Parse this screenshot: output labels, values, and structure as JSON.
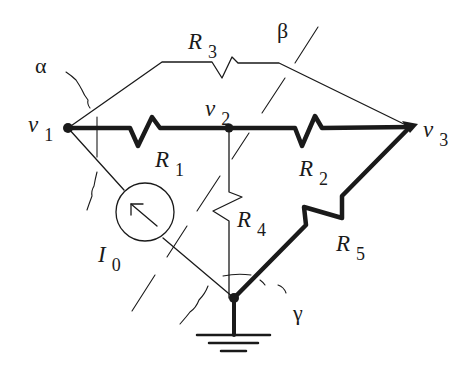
{
  "diagram": {
    "type": "circuit-cutset",
    "colors": {
      "ink": "#1a1a1a",
      "background": "#ffffff"
    },
    "nodes": [
      {
        "id": "v1",
        "label": "v",
        "sub": "1"
      },
      {
        "id": "v2",
        "label": "v",
        "sub": "2"
      },
      {
        "id": "v3",
        "label": "v",
        "sub": "3"
      },
      {
        "id": "ground",
        "label": ""
      }
    ],
    "elements": [
      {
        "id": "R1",
        "label": "R",
        "sub": "1",
        "from": "v1",
        "to": "v2",
        "tree_branch": true
      },
      {
        "id": "R2",
        "label": "R",
        "sub": "2",
        "from": "v2",
        "to": "v3",
        "tree_branch": true
      },
      {
        "id": "R3",
        "label": "R",
        "sub": "3",
        "from": "v1",
        "to": "v3",
        "tree_branch": false
      },
      {
        "id": "R4",
        "label": "R",
        "sub": "4",
        "from": "v2",
        "to": "ground",
        "tree_branch": false
      },
      {
        "id": "R5",
        "label": "R",
        "sub": "5",
        "from": "ground",
        "to": "v3",
        "tree_branch": true
      },
      {
        "id": "I0",
        "label": "I",
        "sub": "0",
        "type": "current-source",
        "from": "ground",
        "to": "v1",
        "tree_branch": false
      }
    ],
    "cutsets": [
      {
        "id": "alpha",
        "label": "α"
      },
      {
        "id": "beta",
        "label": "β"
      },
      {
        "id": "gamma",
        "label": "γ"
      }
    ]
  }
}
